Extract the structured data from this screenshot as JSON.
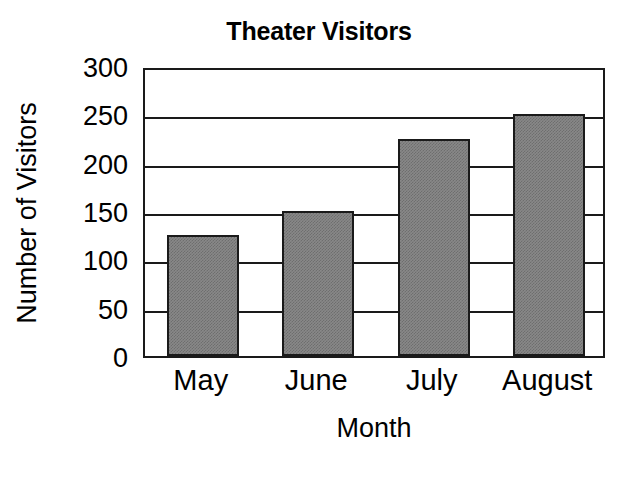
{
  "chart_data": {
    "type": "bar",
    "title": "Theater Visitors",
    "xlabel": "Month",
    "ylabel": "Number of Visitors",
    "categories": [
      "May",
      "June",
      "July",
      "August"
    ],
    "values": [
      125,
      150,
      225,
      250
    ],
    "series": [
      {
        "name": "Number of Visitors",
        "values": [
          125,
          150,
          225,
          250
        ]
      }
    ],
    "ylim": [
      0,
      300
    ],
    "yticks": [
      0,
      50,
      100,
      150,
      200,
      250,
      300
    ],
    "ytick_labels": [
      "0",
      "50",
      "100",
      "150",
      "200",
      "250",
      "300"
    ],
    "grid": true,
    "grid_axis": "y",
    "legend": false,
    "legend_position": "none",
    "bar_fill_color": "#888888",
    "bar_edge_color": "#1a1a1a",
    "axis_color": "#1a1a1a",
    "background_color": "#ffffff",
    "text_color": "#000000"
  }
}
